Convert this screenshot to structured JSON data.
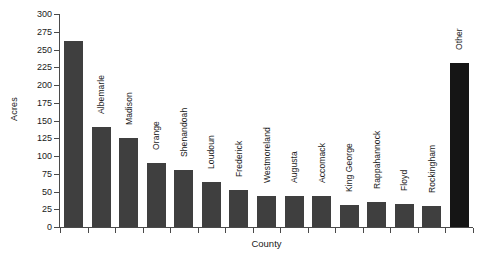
{
  "chart_data": {
    "type": "bar",
    "title": "",
    "xlabel": "County",
    "ylabel": "Acres",
    "ylim": [
      0,
      300
    ],
    "ytick_step": 25,
    "yticks": [
      300,
      275,
      250,
      225,
      200,
      175,
      150,
      125,
      100,
      75,
      50,
      25,
      0
    ],
    "grid": false,
    "legend": "none",
    "categories": [
      "Fauquier",
      "Albemarle",
      "Madison",
      "Orange",
      "Shenandoah",
      "Loudoun",
      "Frederick",
      "Westmoreland",
      "Augusta",
      "Accomack",
      "King George",
      "Rappahannock",
      "Floyd",
      "Rockingham",
      "Other"
    ],
    "values": [
      262,
      141,
      125,
      90,
      80,
      63,
      52,
      44,
      43,
      43,
      31,
      35,
      32,
      30,
      231
    ],
    "bar_colors": [
      "#3f3f3f",
      "#3f3f3f",
      "#3f3f3f",
      "#3f3f3f",
      "#3f3f3f",
      "#3f3f3f",
      "#3f3f3f",
      "#3f3f3f",
      "#3f3f3f",
      "#3f3f3f",
      "#3f3f3f",
      "#3f3f3f",
      "#3f3f3f",
      "#3f3f3f",
      "#151515"
    ],
    "label_placement": [
      "inside",
      "above",
      "above",
      "above",
      "above",
      "above",
      "above",
      "above",
      "above",
      "above",
      "above",
      "above",
      "above",
      "above",
      "above"
    ],
    "axis_color": "#4a4a4a",
    "background": "#ffffff"
  }
}
